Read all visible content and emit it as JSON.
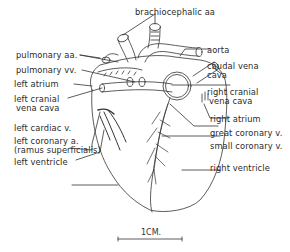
{
  "figure": {
    "labels_left": {
      "pulmonary_aa": "pulmonary aa.",
      "pulmonary_vv": "pulmonary vv.",
      "left_atrium": "left atrium",
      "left_cranial_1": "left cranial",
      "left_cranial_2": "vena cava",
      "left_cardiac_v": "left cardiac v.",
      "left_coronary_1": "left coronary a.",
      "left_coronary_2": "(ramus superficialis)",
      "left_ventricle": "left ventricle"
    },
    "labels_top": {
      "brachiocephalic": "brachiocephalic aa"
    },
    "labels_right": {
      "aorta": "aorta",
      "caudal_1": "caudal vena",
      "caudal_2": "cava",
      "right_cranial_1": "right cranial",
      "right_cranial_2": "vena cava",
      "right_atrium": "right atrium",
      "great_coronary_v": "great coronary v.",
      "small_coronary_v": "small coronary v.",
      "right_ventricle": "right ventricle"
    },
    "scale_bar": {
      "label": "1CM."
    }
  }
}
